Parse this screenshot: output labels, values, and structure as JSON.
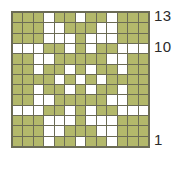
{
  "chart_data": {
    "type": "heatmap",
    "title": "",
    "xlabel": "",
    "ylabel": "",
    "grid": true,
    "legend_position": "none",
    "rows": 13,
    "columns": 13,
    "row_labels_visible": [
      "13",
      "10",
      "1"
    ],
    "row_label_positions": [
      13,
      10,
      1
    ],
    "row_label_side": "right",
    "colors": {
      "filled": "#b3b86b",
      "empty": "#ffffff",
      "gridline": "#6b6b55",
      "label_text": "#2b2b2b"
    },
    "value_legend": {
      "1": "filled",
      "0": "empty"
    },
    "x": [
      1,
      2,
      3,
      4,
      5,
      6,
      7,
      8,
      9,
      10,
      11,
      12,
      13
    ],
    "y": [
      13,
      12,
      11,
      10,
      9,
      8,
      7,
      6,
      5,
      4,
      3,
      2,
      1
    ],
    "values": [
      [
        1,
        1,
        1,
        0,
        1,
        1,
        0,
        1,
        1,
        0,
        1,
        1,
        1
      ],
      [
        1,
        1,
        1,
        0,
        0,
        1,
        1,
        1,
        0,
        0,
        1,
        1,
        1
      ],
      [
        1,
        1,
        1,
        0,
        0,
        0,
        1,
        0,
        0,
        0,
        1,
        1,
        1
      ],
      [
        0,
        0,
        0,
        1,
        1,
        0,
        1,
        0,
        1,
        1,
        0,
        0,
        0
      ],
      [
        1,
        1,
        0,
        0,
        1,
        1,
        1,
        1,
        1,
        0,
        0,
        1,
        1
      ],
      [
        1,
        1,
        0,
        1,
        1,
        0,
        1,
        0,
        1,
        1,
        0,
        1,
        1
      ],
      [
        1,
        1,
        1,
        1,
        0,
        1,
        0,
        1,
        0,
        1,
        1,
        1,
        1
      ],
      [
        1,
        1,
        0,
        1,
        1,
        0,
        1,
        0,
        1,
        1,
        0,
        1,
        1
      ],
      [
        1,
        1,
        0,
        0,
        1,
        1,
        1,
        1,
        1,
        0,
        0,
        1,
        1
      ],
      [
        0,
        0,
        0,
        1,
        1,
        0,
        1,
        0,
        1,
        1,
        0,
        0,
        0
      ],
      [
        1,
        1,
        1,
        0,
        0,
        0,
        1,
        0,
        0,
        0,
        1,
        1,
        1
      ],
      [
        1,
        1,
        1,
        0,
        0,
        1,
        1,
        1,
        0,
        0,
        1,
        1,
        1
      ],
      [
        1,
        1,
        1,
        0,
        1,
        1,
        0,
        1,
        1,
        0,
        1,
        1,
        1
      ]
    ]
  },
  "labels": {
    "top": "13",
    "middle": "10",
    "bottom": "1"
  }
}
